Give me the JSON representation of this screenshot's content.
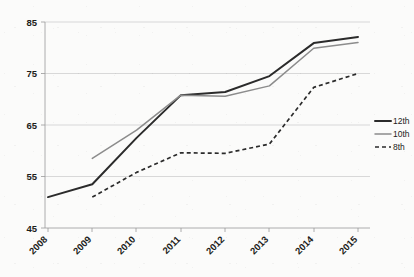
{
  "chart_data": {
    "type": "line",
    "title": "",
    "subtitle": "",
    "xlabel": "",
    "ylabel": "",
    "x": [
      2008,
      2009,
      2010,
      2011,
      2012,
      2013,
      2014,
      2015
    ],
    "categories": [
      "2008",
      "2009",
      "2010",
      "2011",
      "2012",
      "2013",
      "2014",
      "2015"
    ],
    "xlim": [
      2008,
      2015
    ],
    "ylim": [
      45,
      85
    ],
    "yticks": [
      45,
      55,
      65,
      75,
      85
    ],
    "ytick_labels": [
      "45",
      "55",
      "65",
      "75",
      "85"
    ],
    "xtick_labels": [
      "2008",
      "2009",
      "2010",
      "2011",
      "2012",
      "2013",
      "2014",
      "2015"
    ],
    "grid": true,
    "grid_axis": "y",
    "legend_position": "right",
    "series": [
      {
        "name": "12th",
        "style": "solid-thick",
        "color": "#2b2b2b",
        "x": [
          2008,
          2009,
          2010,
          2011,
          2012,
          2013,
          2014,
          2015
        ],
        "values": [
          51.0,
          53.5,
          62.5,
          70.8,
          71.4,
          74.5,
          80.9,
          82.1
        ]
      },
      {
        "name": "10th",
        "style": "solid-thin",
        "color": "#8c8c8c",
        "x": [
          2009,
          2010,
          2011,
          2012,
          2013,
          2014,
          2015
        ],
        "values": [
          58.5,
          64.0,
          70.8,
          70.6,
          72.6,
          79.9,
          81.0
        ]
      },
      {
        "name": "8th",
        "style": "dashed",
        "color": "#2b2b2b",
        "x": [
          2009,
          2010,
          2011,
          2012,
          2013,
          2014,
          2015
        ],
        "values": [
          51.0,
          55.8,
          59.6,
          59.5,
          61.3,
          72.3,
          75.0
        ]
      }
    ],
    "legend": [
      {
        "label": "12th",
        "style": "solid-thick",
        "color": "#2b2b2b"
      },
      {
        "label": "10th",
        "style": "solid-thin",
        "color": "#8c8c8c"
      },
      {
        "label": "8th",
        "style": "dashed",
        "color": "#2b2b2b"
      }
    ]
  },
  "colors": {
    "background": "#fbfbfa",
    "grid": "#c8c8c8",
    "axis": "#9a9a9a",
    "text": "#1d1d1b",
    "series_12th": "#2b2b2b",
    "series_10th": "#8c8c8c",
    "series_8th": "#2b2b2b"
  }
}
